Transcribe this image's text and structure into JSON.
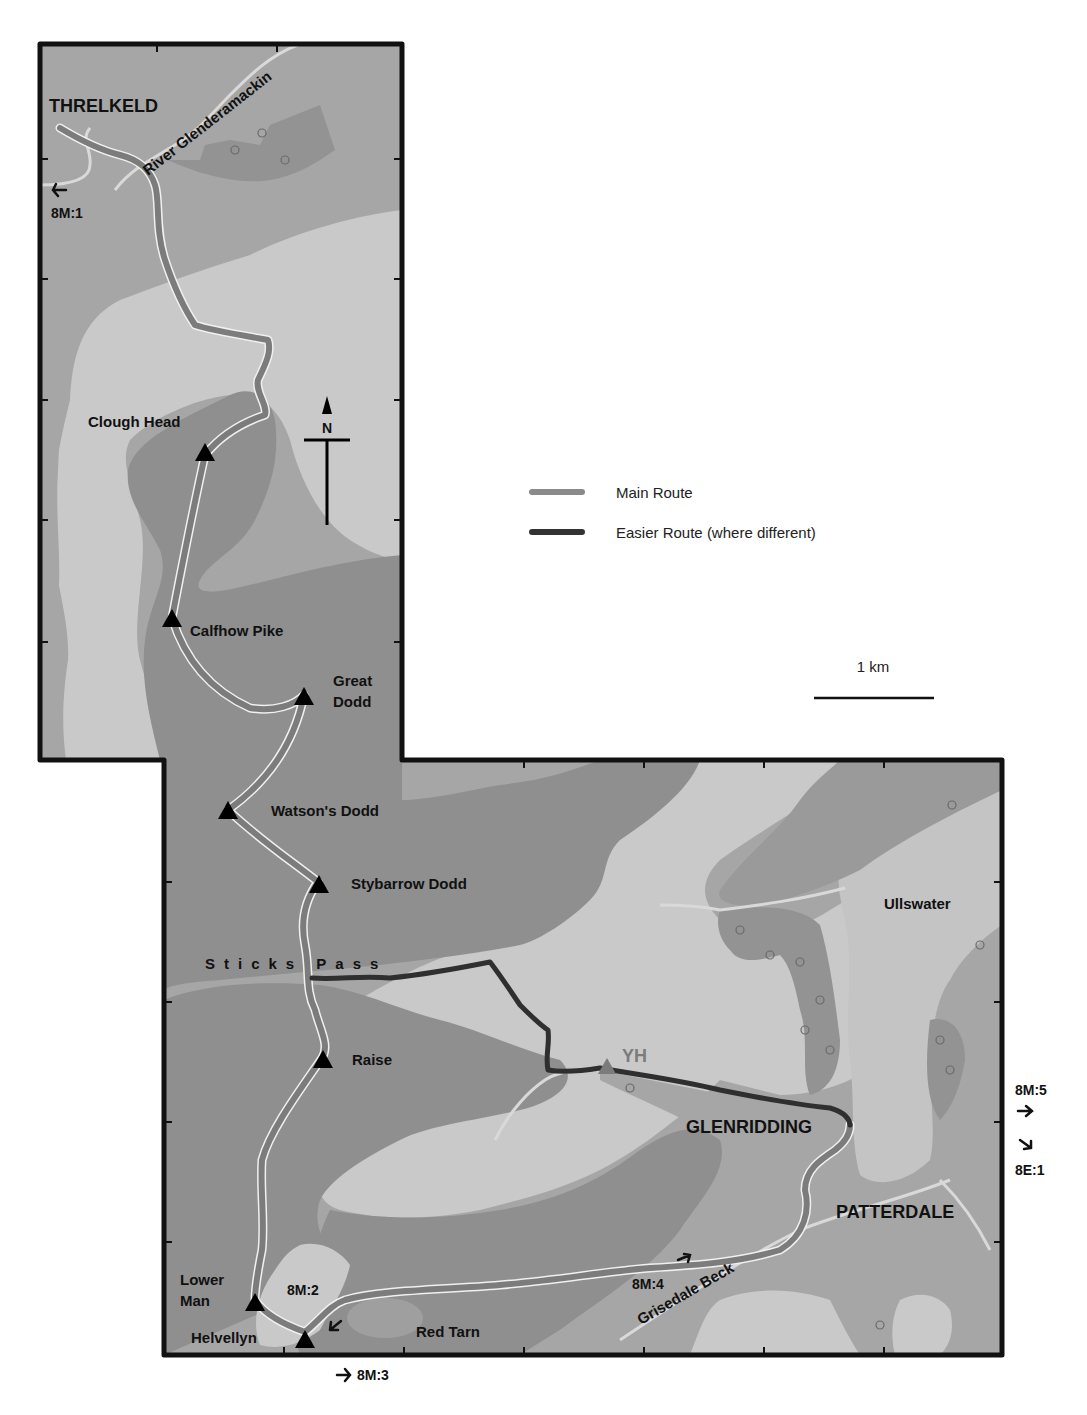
{
  "map": {
    "title": "Threlkeld to Patterdale via Helvellyn ridge",
    "colors": {
      "background": "#ffffff",
      "low_ground": "#a6a6a6",
      "fell": "#c9c9c9",
      "high_ground": "#8f8f8f",
      "woodland": "#939393",
      "water_stream": "#d6d6d6",
      "main_route": "#7c7c7c",
      "easier_route": "#2f2f2f",
      "frame": "#111111"
    },
    "towns": [
      {
        "name": "THRELKELD"
      },
      {
        "name": "GLENRIDDING"
      },
      {
        "name": "PATTERDALE"
      }
    ],
    "summits": [
      {
        "name": "Clough Head"
      },
      {
        "name": "Calfhow Pike"
      },
      {
        "name": "Great",
        "name2": "Dodd"
      },
      {
        "name": "Watson's Dodd"
      },
      {
        "name": "Stybarrow Dodd"
      },
      {
        "name": "Raise"
      },
      {
        "name": "Lower",
        "name2": "Man"
      },
      {
        "name": "Helvellyn"
      }
    ],
    "features": {
      "river": "River Glenderamackin",
      "pass": "Sticks Pass",
      "lake": "Ullswater",
      "tarn": "Red Tarn",
      "beck": "Grisedale Beck",
      "hostel": "YH"
    },
    "refs": {
      "r1": "8M:1",
      "r2": "8M:2",
      "r3": "8M:3",
      "r4": "8M:4",
      "r5": "8M:5",
      "r6": "8E:1"
    },
    "north": "N",
    "legend": {
      "main": "Main Route",
      "easier": "Easier Route (where different)"
    },
    "scale": {
      "label": "1 km"
    }
  }
}
